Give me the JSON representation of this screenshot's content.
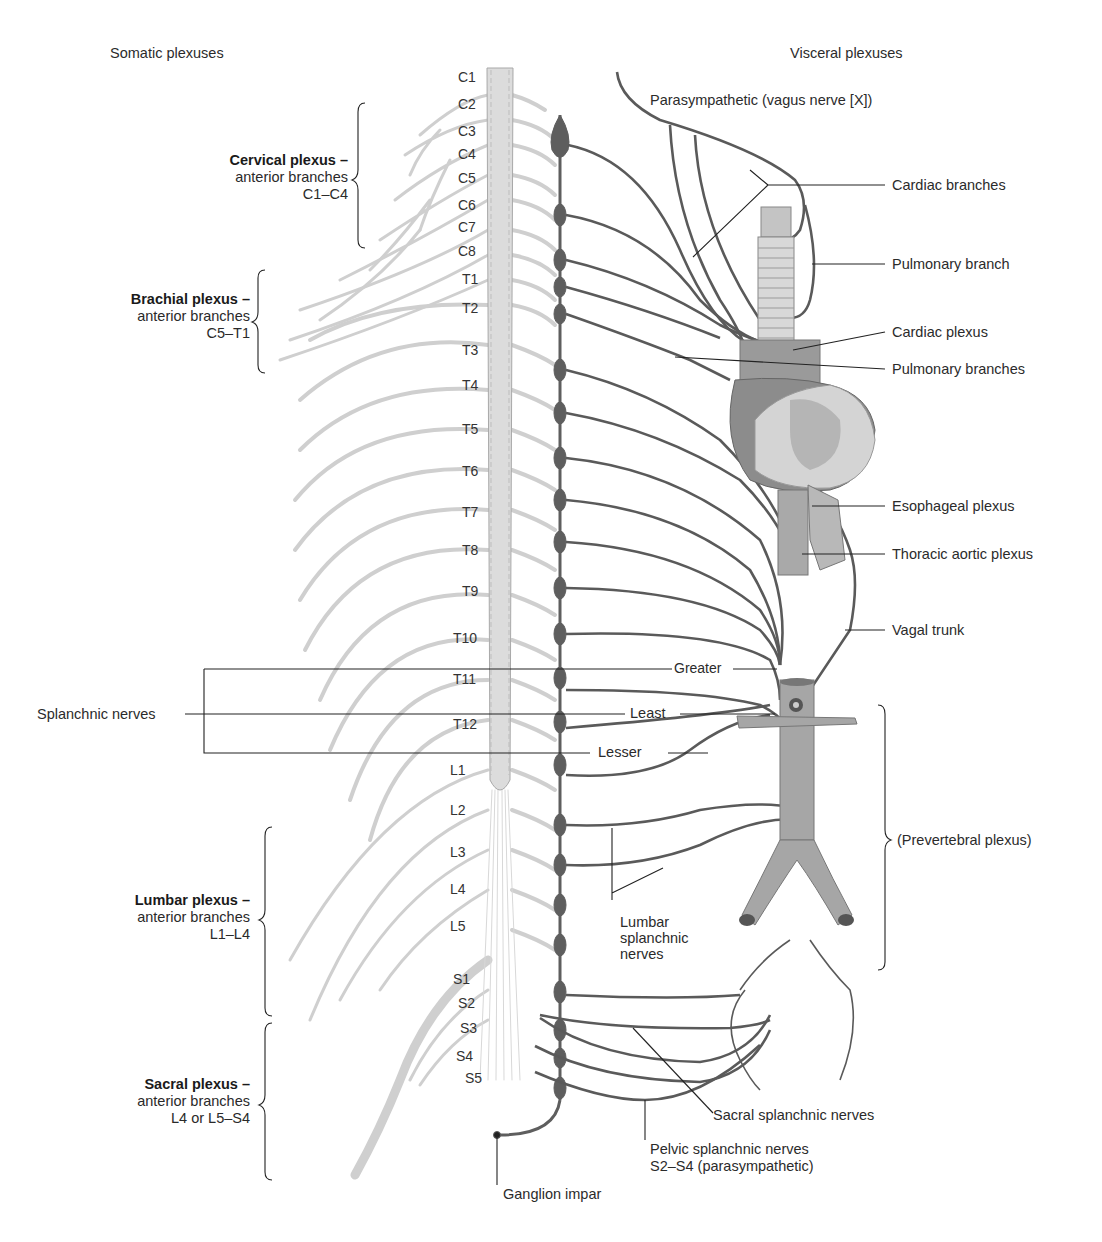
{
  "headers": {
    "somatic": "Somatic plexuses",
    "visceral": "Visceral plexuses"
  },
  "segments": {
    "cervical": [
      "C1",
      "C2",
      "C3",
      "C4",
      "C5",
      "C6",
      "C7",
      "C8"
    ],
    "thoracic": [
      "T1",
      "T2",
      "T3",
      "T4",
      "T5",
      "T6",
      "T7",
      "T8",
      "T9",
      "T10",
      "T11",
      "T12"
    ],
    "lumbar": [
      "L1",
      "L2",
      "L3",
      "L4",
      "L5"
    ],
    "sacral": [
      "S1",
      "S2",
      "S3",
      "S4",
      "S5"
    ]
  },
  "somatic_plexuses": [
    {
      "title": "Cervical plexus –",
      "line2": "anterior branches",
      "line3": "C1–C4"
    },
    {
      "title": "Brachial plexus –",
      "line2": "anterior branches",
      "line3": "C5–T1"
    },
    {
      "title": "Lumbar plexus –",
      "line2": "anterior branches",
      "line3": "L1–L4"
    },
    {
      "title": "Sacral plexus –",
      "line2": "anterior branches",
      "line3": "L4 or L5–S4"
    }
  ],
  "splanchnic": {
    "group_label": "Splanchnic nerves",
    "greater": "Greater",
    "least": "Least",
    "lesser": "Lesser"
  },
  "visceral_labels": {
    "parasympathetic": "Parasympathetic  (vagus nerve [X])",
    "cardiac_branches": "Cardiac branches",
    "pulmonary_branch": "Pulmonary branch",
    "cardiac_plexus": "Cardiac plexus",
    "pulmonary_branches": "Pulmonary branches",
    "esophageal_plexus": "Esophageal plexus",
    "thoracic_aortic_plexus": "Thoracic aortic plexus",
    "vagal_trunk": "Vagal trunk",
    "prevertebral_plexus": "(Prevertebral plexus)",
    "lumbar_splanchnic_1": "Lumbar",
    "lumbar_splanchnic_2": "splanchnic",
    "lumbar_splanchnic_3": "nerves",
    "sacral_splanchnic": "Sacral splanchnic nerves",
    "pelvic_splanchnic_1": "Pelvic splanchnic nerves",
    "pelvic_splanchnic_2": "S2–S4 (parasympathetic)",
    "ganglion_impar": "Ganglion impar"
  },
  "colors": {
    "somatic_nerve": "#cfcfcf",
    "spinal_cord": "#dcdcdc",
    "sympathetic_trunk": "#5e5e5e",
    "visceral_nerve": "#5a5a5a",
    "leader_line": "#222222",
    "organ_fill": "#9a9a9a",
    "heart_light": "#d4d4d4"
  }
}
